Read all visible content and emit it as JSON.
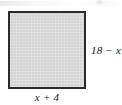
{
  "figure": {
    "type": "geometry-diagram",
    "shape": {
      "name": "square",
      "fill_color": "#d4d4d4",
      "border_color": "#2b2b2b"
    },
    "labels": {
      "right_side": "18 − x",
      "bottom_side": "x + 4"
    }
  },
  "diagram_data": {
    "type": "diagram",
    "shape": "square",
    "side_expressions": {
      "width": "x + 4",
      "height": "18 − x"
    },
    "annotations": [
      {
        "position": "right",
        "text": "18 − x"
      },
      {
        "position": "bottom",
        "text": "x + 4"
      }
    ]
  }
}
